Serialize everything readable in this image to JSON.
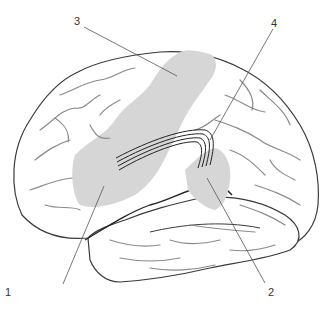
{
  "diagram": {
    "type": "lateral view of left cerebral hemisphere (brain) with highlighted language areas",
    "colors": {
      "background": "#ffffff",
      "outline": "#3a3a3a",
      "sulci": "#8a8a8a",
      "highlight": "#d6d6d6",
      "leader_line": "#555555",
      "fasciculus": "#222222"
    },
    "labels": [
      {
        "id": "1",
        "text": "1",
        "x": 5,
        "y": 287
      },
      {
        "id": "2",
        "text": "2",
        "x": 268,
        "y": 287
      },
      {
        "id": "3",
        "text": "3",
        "x": 74,
        "y": 16
      },
      {
        "id": "4",
        "text": "4",
        "x": 271,
        "y": 18
      }
    ]
  }
}
